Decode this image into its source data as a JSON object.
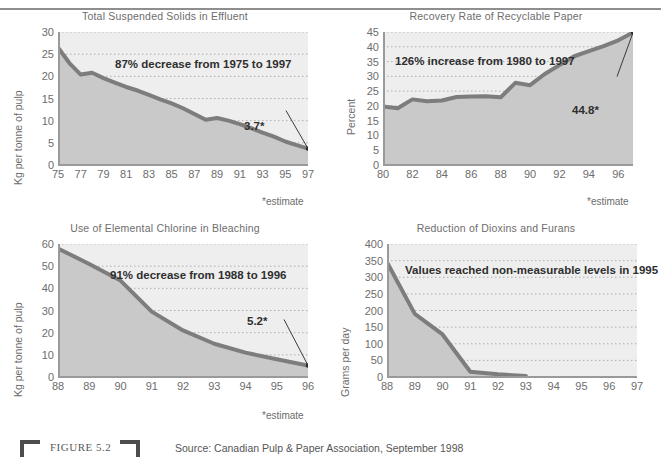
{
  "figure": {
    "label": "FIGURE 5.2",
    "source": "Source: Canadian Pulp & Paper Association, September 1998",
    "estimate_note": "*estimate"
  },
  "chart_data": [
    {
      "id": "total-suspended-solids",
      "type": "area",
      "title": "Total Suspended Solids in Effluent",
      "xlabel": "",
      "ylabel": "Kg per tonne of pulp",
      "ylim": [
        0,
        30
      ],
      "yticks": [
        0,
        5,
        10,
        15,
        20,
        25,
        30
      ],
      "xticks": [
        "75",
        "77",
        "79",
        "81",
        "83",
        "85",
        "87",
        "89",
        "91",
        "93",
        "95",
        "97"
      ],
      "x": [
        1975,
        1976,
        1977,
        1978,
        1979,
        1980,
        1981,
        1982,
        1983,
        1984,
        1985,
        1986,
        1987,
        1988,
        1989,
        1990,
        1991,
        1992,
        1993,
        1994,
        1995,
        1996,
        1997
      ],
      "values": [
        26.5,
        23.0,
        20.4,
        20.8,
        19.6,
        18.6,
        17.6,
        16.8,
        15.8,
        14.8,
        13.9,
        12.8,
        11.5,
        10.2,
        10.6,
        10.0,
        9.2,
        8.3,
        7.3,
        6.4,
        5.3,
        4.5,
        3.7
      ],
      "annotation": "87% decrease from 1975 to 1997",
      "callout": "3.7*",
      "grid": true,
      "legend": "none"
    },
    {
      "id": "recovery-rate",
      "type": "area",
      "title": "Recovery Rate of Recyclable Paper",
      "xlabel": "",
      "ylabel": "Percent",
      "ylim": [
        0,
        45
      ],
      "yticks": [
        0,
        5,
        10,
        15,
        20,
        25,
        30,
        35,
        40,
        45
      ],
      "xticks": [
        "80",
        "82",
        "84",
        "86",
        "88",
        "90",
        "92",
        "94",
        "96"
      ],
      "x": [
        1980,
        1981,
        1982,
        1983,
        1984,
        1985,
        1986,
        1987,
        1988,
        1989,
        1990,
        1991,
        1992,
        1993,
        1994,
        1995,
        1996,
        1997
      ],
      "values": [
        19.8,
        19.2,
        22.2,
        21.6,
        21.8,
        23.0,
        23.2,
        23.3,
        22.9,
        27.8,
        27.0,
        30.8,
        33.8,
        36.8,
        38.5,
        40.2,
        42.2,
        44.8
      ],
      "annotation": "126% increase from 1980 to 1997",
      "callout": "44.8*",
      "grid": true,
      "legend": "none"
    },
    {
      "id": "elemental-chlorine",
      "type": "area",
      "title": "Use of Elemental Chlorine in Bleaching",
      "xlabel": "",
      "ylabel": "Kg per tonne of pulp",
      "ylim": [
        0,
        60
      ],
      "yticks": [
        0,
        10,
        20,
        30,
        40,
        50,
        60
      ],
      "xticks": [
        "88",
        "89",
        "90",
        "91",
        "92",
        "93",
        "94",
        "95",
        "96"
      ],
      "x": [
        1988,
        1989,
        1990,
        1991,
        1992,
        1993,
        1994,
        1995,
        1996
      ],
      "values": [
        58.0,
        51.0,
        43.5,
        29.5,
        21.0,
        15.0,
        11.0,
        8.0,
        5.2
      ],
      "annotation": "91% decrease from 1988 to 1996",
      "callout": "5.2*",
      "grid": true,
      "legend": "none"
    },
    {
      "id": "dioxins-furans",
      "type": "area",
      "title": "Reduction of Dioxins and Furans",
      "xlabel": "",
      "ylabel": "Grams per day",
      "ylim": [
        0,
        400
      ],
      "yticks": [
        0,
        50,
        100,
        150,
        200,
        250,
        300,
        350,
        400
      ],
      "xticks": [
        "88",
        "89",
        "90",
        "91",
        "92",
        "93",
        "94",
        "95",
        "96",
        "97"
      ],
      "x": [
        1988,
        1989,
        1990,
        1991,
        1992,
        1993
      ],
      "values": [
        345,
        190,
        128,
        16,
        8,
        3
      ],
      "annotation": "Values reached non-measurable levels in 1995",
      "callout": "",
      "grid": true,
      "legend": "none"
    }
  ],
  "colors": {
    "line": "#7d7d7d",
    "fill_upper": "#eeeeee",
    "fill_lower": "#c9c9c9",
    "axis": "#9a9a9a",
    "text": "#6d6d6d",
    "annotation_text": "#2f2f2f"
  }
}
